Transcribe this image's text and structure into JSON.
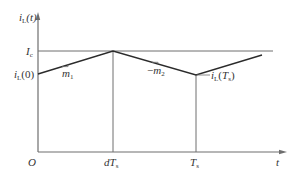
{
  "diagram": {
    "colors": {
      "axis": "#6e6e6e",
      "waveform": "#2b2b2b",
      "text": "#333333",
      "background": "#ffffff"
    },
    "labels": {
      "y_axis": "iL(t)",
      "x_axis": "t",
      "origin": "O",
      "ic": "Ic",
      "il0": "iL(0)",
      "m1": "m1",
      "m2": "−m2",
      "ilts": "iL(Ts)",
      "dts": "dTs",
      "ts": "Ts"
    },
    "points": {
      "start": {
        "t": "0",
        "value": "iL(0)"
      },
      "peak": {
        "t": "dTs",
        "value": "Ic"
      },
      "valley": {
        "t": "Ts",
        "value": "iL(Ts)"
      }
    },
    "slopes": {
      "rising": "m1",
      "falling": "-m2"
    }
  }
}
